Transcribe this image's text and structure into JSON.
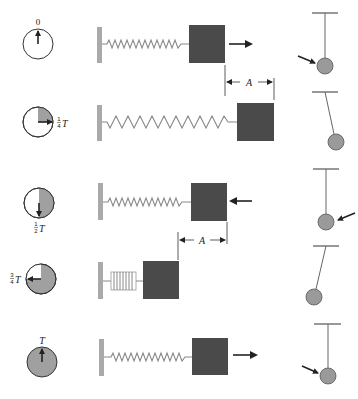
{
  "figure": {
    "colors": {
      "block": "#4a4a4a",
      "wall": "#aaaaaa",
      "clock_fill": "#a0a0a0",
      "bob": "#9a9a9a",
      "line": "#222222",
      "spring": "#888888"
    },
    "rows": [
      {
        "clock_label": "0",
        "clock_label_frac": "",
        "clock_fill_fraction": 0,
        "hand": "up",
        "spring_state": "equilibrium",
        "velocity_arrow": "right",
        "pendulum": "bottom-moving-right"
      },
      {
        "clock_label": "T",
        "clock_label_frac": "1/4",
        "clock_fill_fraction": 0.25,
        "hand": "right",
        "spring_state": "stretched",
        "velocity_arrow": "none",
        "pendulum": "max-right"
      },
      {
        "clock_label": "T",
        "clock_label_frac": "1/2",
        "clock_fill_fraction": 0.5,
        "hand": "down",
        "spring_state": "equilibrium",
        "velocity_arrow": "left",
        "pendulum": "bottom-moving-left"
      },
      {
        "clock_label": "T",
        "clock_label_frac": "3/4",
        "clock_fill_fraction": 0.75,
        "hand": "left",
        "spring_state": "compressed",
        "velocity_arrow": "none",
        "pendulum": "max-left"
      },
      {
        "clock_label": "T",
        "clock_label_frac": "",
        "clock_fill_fraction": 1,
        "hand": "up",
        "spring_state": "equilibrium",
        "velocity_arrow": "right",
        "pendulum": "bottom-moving-right"
      }
    ],
    "amplitude_markers": [
      {
        "label": "A",
        "position": "between rows 1 and 2"
      },
      {
        "label": "A",
        "position": "between rows 3 and 4"
      }
    ],
    "labels": {
      "row1_time": "0",
      "row2_num": "1",
      "row2_den": "4",
      "row2_T": "T",
      "row3_num": "1",
      "row3_den": "2",
      "row3_T": "T",
      "row4_num": "3",
      "row4_den": "4",
      "row4_T": "T",
      "row5_time": "T",
      "amp1": "A",
      "amp2": "A"
    }
  }
}
